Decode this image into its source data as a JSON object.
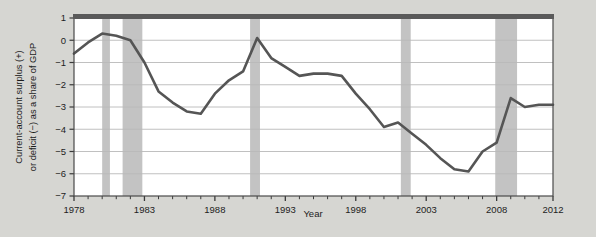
{
  "figure": {
    "background_color": "#d6d6d2",
    "plot_background_color": "#ffffff"
  },
  "chart_data": {
    "type": "line",
    "title": "",
    "xlabel": "Year",
    "ylabel": "Current-account surplus (+) or deficit (−) as a share of GDP",
    "ylabel_line1": "Current-account surplus (+)",
    "ylabel_line2": "or deficit (−) as a share of GDP",
    "xlim": [
      1978,
      2012
    ],
    "ylim": [
      -7,
      1
    ],
    "ytick_labels": [
      "1",
      "0",
      "−1",
      "−2",
      "−3",
      "−4",
      "−5",
      "−6",
      "−7"
    ],
    "ytick_values": [
      1,
      0,
      -1,
      -2,
      -3,
      -4,
      -5,
      -6,
      -7
    ],
    "xtick_labels": [
      "1978",
      "1983",
      "1988",
      "1993",
      "1998",
      "2003",
      "2008",
      "2012"
    ],
    "xtick_values": [
      1978,
      1983,
      1988,
      1993,
      1998,
      2003,
      2008,
      2012
    ],
    "xtick_minor_step": 1,
    "grid": "horizontal",
    "legend": "none",
    "line_color": "#555555",
    "line_width": 2.6,
    "recession_band_color": "#c3c3c3",
    "x": [
      1978,
      1979,
      1980,
      1981,
      1982,
      1983,
      1984,
      1985,
      1986,
      1987,
      1988,
      1989,
      1990,
      1991,
      1992,
      1993,
      1994,
      1995,
      1996,
      1997,
      1998,
      1999,
      2000,
      2001,
      2002,
      2003,
      2004,
      2005,
      2006,
      2007,
      2008,
      2009,
      2010,
      2011,
      2012
    ],
    "values": [
      -0.6,
      -0.1,
      0.3,
      0.2,
      0.0,
      -1.0,
      -2.3,
      -2.8,
      -3.2,
      -3.3,
      -2.4,
      -1.8,
      -1.4,
      0.1,
      -0.8,
      -1.2,
      -1.6,
      -1.5,
      -1.5,
      -1.6,
      -2.4,
      -3.1,
      -3.9,
      -3.7,
      -4.2,
      -4.7,
      -5.3,
      -5.8,
      -5.9,
      -5.0,
      -4.6,
      -2.6,
      -3.0,
      -2.9,
      -2.9
    ],
    "recessions": [
      {
        "start": 1980.0,
        "end": 1980.55
      },
      {
        "start": 1981.45,
        "end": 1982.85
      },
      {
        "start": 1990.5,
        "end": 1991.2
      },
      {
        "start": 2001.2,
        "end": 2001.9
      },
      {
        "start": 2007.9,
        "end": 2009.45
      }
    ]
  }
}
